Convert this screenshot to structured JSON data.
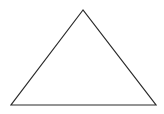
{
  "diagram": {
    "shape": "triangle",
    "background": "#ffffff",
    "stroke_color": "#2a2a2a",
    "fill_color": "none",
    "stroke_width": 1.2,
    "vertices": {
      "apex": [
        83,
        10
      ],
      "bottom_left": [
        11,
        105
      ],
      "bottom_right": [
        156,
        105
      ]
    },
    "points": "83,10 11,105 156,105"
  }
}
